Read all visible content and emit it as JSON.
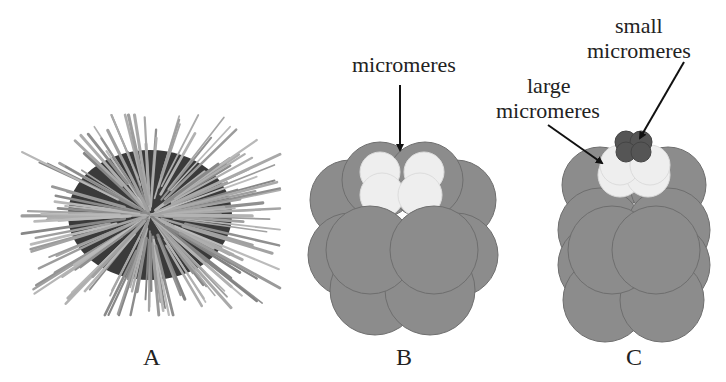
{
  "figure": {
    "panels": [
      {
        "id": "A",
        "label": "A",
        "subject": "sea urchin"
      },
      {
        "id": "B",
        "label": "B",
        "subject": "16-cell embryo"
      },
      {
        "id": "C",
        "label": "C",
        "subject": "32-cell embryo"
      }
    ],
    "annotations": {
      "b_micromeres": "micromeres",
      "c_small_line1": "small",
      "c_small_line2": "micromeres",
      "c_large_line1": "large",
      "c_large_line2": "micromeres"
    },
    "colors": {
      "macromere": "#8c8c8c",
      "outline": "#6e6e6e",
      "micromere": "#eeeeee",
      "small_micromere": "#555555",
      "spine": "#9a9a9a",
      "urchin_body": "#3a3a3a",
      "arrow": "#111111"
    }
  }
}
